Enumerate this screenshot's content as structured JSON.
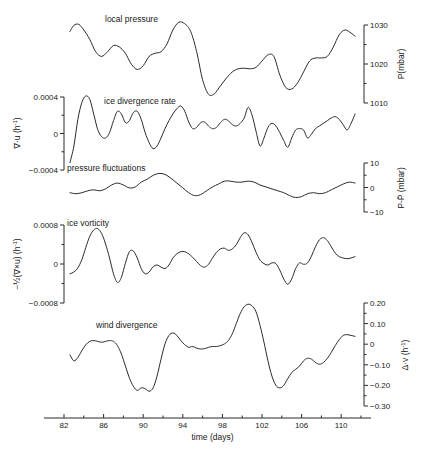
{
  "figure": {
    "background": "#ffffff",
    "line_color": "#2b2b2b",
    "xaxis": {
      "label": "time (days)",
      "ticks": [
        "82",
        "86",
        "90",
        "94",
        "98",
        "102",
        "106",
        "110"
      ],
      "range": [
        82,
        112
      ]
    }
  },
  "panels": [
    {
      "id": "local-pressure",
      "curve_label": "local pressure",
      "axis_side": "right",
      "axis_title": "P(mbar)",
      "ticks": [
        "1030",
        "1020",
        "1010"
      ],
      "range": [
        1006,
        1034
      ]
    },
    {
      "id": "ice-divergence-rate",
      "curve_label": "ice divergence rate",
      "axis_side": "left",
      "axis_title_main": "∇·u",
      "axis_title_units": "(h",
      "axis_title_exp": "-1",
      "axis_title_close": ")",
      "ticks": [
        "0.0004",
        "0",
        "−0.0004"
      ],
      "range": [
        -0.0006,
        0.0006
      ]
    },
    {
      "id": "pressure-fluctuations",
      "curve_label": "pressure fluctuations",
      "axis_side": "right",
      "axis_title": "P-P̄ (mbar)",
      "ticks": [
        "10",
        "0",
        "−10"
      ],
      "range": [
        -14,
        14
      ]
    },
    {
      "id": "ice-vorticity",
      "curve_label": "ice vorticity",
      "axis_side": "left",
      "axis_title_main": "−½(∇×u)",
      "axis_title_units": "(h",
      "axis_title_exp": "-1",
      "axis_title_close": ")",
      "ticks": [
        "0.0008",
        "0",
        "−0.0008"
      ],
      "range": [
        -0.0012,
        0.0012
      ]
    },
    {
      "id": "wind-divergence",
      "curve_label": "wind divergence",
      "axis_side": "right",
      "axis_title_main": "Δ·v",
      "axis_title_units": "(h",
      "axis_title_exp": "-1",
      "axis_title_close": ")",
      "ticks": [
        "0.20",
        "0.10",
        "0",
        "−0.10",
        "−0.20",
        "−0.30"
      ],
      "range": [
        -0.33,
        0.25
      ]
    }
  ],
  "chart_data": {
    "type": "line",
    "title": "",
    "xlabel": "time (days)",
    "ylabel": "",
    "xlim": [
      82,
      112
    ],
    "grid": false,
    "legend": "inline-curve-labels",
    "series": [
      {
        "name": "local pressure",
        "unit": "mbar",
        "ylabel": "P(mbar)",
        "ylim": [
          1006,
          1034
        ],
        "yticks": [
          1030,
          1020,
          1010
        ],
        "x": [
          82.6,
          83.0,
          83.5,
          84.0,
          84.6,
          85.2,
          85.8,
          86.4,
          87.0,
          87.6,
          88.2,
          88.8,
          89.4,
          90.0,
          90.6,
          91.2,
          91.8,
          92.4,
          93.0,
          93.6,
          94.2,
          94.8,
          95.4,
          96.0,
          96.6,
          97.2,
          97.8,
          98.4,
          99.0,
          99.6,
          100.2,
          100.8,
          101.4,
          102.0,
          102.6,
          103.2,
          103.8,
          104.4,
          105.0,
          105.6,
          106.2,
          106.8,
          107.4,
          108.0,
          108.6,
          109.2,
          109.8,
          110.4,
          111.0,
          111.4
        ],
        "y": [
          1029.0,
          1031.0,
          1031.3,
          1029.5,
          1026.5,
          1022.5,
          1021.0,
          1022.5,
          1024.5,
          1024.0,
          1022.0,
          1018.5,
          1016.8,
          1018.0,
          1021.0,
          1022.0,
          1022.5,
          1025.0,
          1029.5,
          1032.0,
          1031.5,
          1029.0,
          1022.5,
          1013.5,
          1008.8,
          1009.0,
          1011.5,
          1014.0,
          1016.0,
          1017.0,
          1017.2,
          1017.0,
          1017.5,
          1019.5,
          1021.5,
          1021.0,
          1015.0,
          1011.0,
          1010.5,
          1012.5,
          1016.0,
          1019.5,
          1020.5,
          1020.5,
          1021.0,
          1024.0,
          1028.0,
          1029.5,
          1028.5,
          1027.5
        ]
      },
      {
        "name": "ice divergence rate",
        "unit": "h^-1",
        "ylabel": "∇·u (h⁻¹)",
        "ylim": [
          -0.0006,
          0.0006
        ],
        "yticks": [
          0.0004,
          0,
          -0.0004
        ],
        "x": [
          82.6,
          83.0,
          83.4,
          83.8,
          84.2,
          84.6,
          85.0,
          85.4,
          85.8,
          86.2,
          86.6,
          87.0,
          87.4,
          87.8,
          88.2,
          88.6,
          89.0,
          89.4,
          89.8,
          90.2,
          90.6,
          91.0,
          91.4,
          91.8,
          92.2,
          92.6,
          93.0,
          93.4,
          93.8,
          94.2,
          94.6,
          95.0,
          95.4,
          95.8,
          96.2,
          96.6,
          97.0,
          97.4,
          97.8,
          98.2,
          98.6,
          99.0,
          99.4,
          99.8,
          100.2,
          100.6,
          101.0,
          101.4,
          101.8,
          102.2,
          102.6,
          103.0,
          103.4,
          103.8,
          104.2,
          104.6,
          105.0,
          105.4,
          105.8,
          106.2,
          106.6,
          107.0,
          107.4,
          107.8,
          108.2,
          108.6,
          109.0,
          109.4,
          109.8,
          110.2,
          110.6,
          111.0,
          111.4
        ],
        "y": [
          -0.00055,
          -0.0003,
          0.0001,
          0.00035,
          0.00045,
          0.0004,
          0.00018,
          -5e-05,
          -0.00016,
          -0.00018,
          -0.0001,
          8e-05,
          0.00022,
          0.00018,
          5e-05,
          8e-05,
          0.0002,
          0.00022,
          0.0001,
          -0.0001,
          -0.00025,
          -0.00034,
          -0.0003,
          -0.00018,
          -4e-05,
          8e-05,
          0.00018,
          0.00026,
          0.0003,
          0.00022,
          6e-05,
          -4e-05,
          -2e-05,
          5e-05,
          6e-05,
          0.0,
          -4e-05,
          -2e-05,
          5e-05,
          0.0001,
          8e-05,
          2e-05,
          0.0,
          4e-05,
          0.00012,
          0.00028,
          0.00016,
          -8e-05,
          -0.0003,
          -0.00018,
          -2e-05,
          4e-05,
          0.0,
          -0.0001,
          -0.00022,
          -0.00032,
          -0.00018,
          -6e-05,
          -4e-05,
          -6e-05,
          -0.00018,
          -0.00012,
          -4e-05,
          0.0,
          4e-05,
          8e-05,
          0.00012,
          0.00014,
          0.0001,
          2e-05,
          -6e-05,
          4e-05,
          0.00018
        ]
      },
      {
        "name": "pressure fluctuations",
        "unit": "mbar",
        "ylabel": "P-P̄ (mbar)",
        "ylim": [
          -14,
          14
        ],
        "yticks": [
          10,
          0,
          -10
        ],
        "x": [
          82.6,
          83.2,
          83.8,
          84.4,
          85.0,
          85.6,
          86.2,
          86.8,
          87.4,
          88.0,
          88.6,
          89.2,
          89.8,
          90.4,
          91.0,
          91.6,
          92.2,
          92.8,
          93.4,
          94.0,
          94.6,
          95.2,
          95.8,
          96.4,
          97.0,
          97.6,
          98.2,
          98.8,
          99.4,
          100.0,
          100.6,
          101.2,
          101.8,
          102.4,
          103.0,
          103.6,
          104.2,
          104.8,
          105.4,
          106.0,
          106.6,
          107.2,
          107.8,
          108.4,
          109.0,
          109.6,
          110.2,
          110.8,
          111.4
        ],
        "y": [
          -4.0,
          -4.5,
          -4.0,
          -3.0,
          -2.5,
          -3.0,
          -2.0,
          0.0,
          1.0,
          0.0,
          -1.5,
          -1.0,
          1.5,
          3.0,
          5.0,
          6.0,
          5.5,
          3.5,
          1.0,
          -1.5,
          -4.0,
          -5.5,
          -5.0,
          -3.0,
          -1.0,
          0.5,
          2.0,
          2.0,
          1.5,
          1.5,
          2.0,
          1.5,
          0.0,
          -1.0,
          -2.0,
          -3.0,
          -4.0,
          -5.5,
          -6.5,
          -6.0,
          -4.5,
          -4.0,
          -4.5,
          -4.0,
          -2.5,
          -1.0,
          0.5,
          1.5,
          1.0
        ]
      },
      {
        "name": "ice vorticity",
        "unit": "h^-1",
        "ylabel": "-½(∇×u) (h⁻¹)",
        "ylim": [
          -0.0012,
          0.0012
        ],
        "yticks": [
          0.0008,
          0,
          -0.0008
        ],
        "x": [
          82.6,
          83.0,
          83.4,
          83.8,
          84.2,
          84.6,
          85.0,
          85.4,
          85.8,
          86.2,
          86.6,
          87.0,
          87.4,
          87.8,
          88.2,
          88.6,
          89.0,
          89.4,
          89.8,
          90.2,
          90.6,
          91.0,
          91.4,
          91.8,
          92.2,
          92.6,
          93.0,
          93.4,
          93.8,
          94.2,
          94.6,
          95.0,
          95.4,
          95.8,
          96.2,
          96.6,
          97.0,
          97.4,
          97.8,
          98.2,
          98.6,
          99.0,
          99.4,
          99.8,
          100.2,
          100.6,
          101.0,
          101.4,
          101.8,
          102.2,
          102.6,
          103.0,
          103.4,
          103.8,
          104.2,
          104.6,
          105.0,
          105.4,
          105.8,
          106.2,
          106.6,
          107.0,
          107.4,
          107.8,
          108.2,
          108.6,
          109.0,
          109.4,
          109.8,
          110.2,
          110.6,
          111.0,
          111.4
        ],
        "y": [
          -0.00045,
          -0.0004,
          -0.00028,
          -5e-05,
          0.0003,
          0.00062,
          0.0008,
          0.00084,
          0.0007,
          0.0004,
          0.0,
          -0.00045,
          -0.0007,
          -0.00055,
          -0.00015,
          0.00018,
          0.0002,
          0.0,
          -0.0003,
          -0.00045,
          -0.0004,
          -0.00025,
          -0.0002,
          -0.00026,
          -0.0003,
          -0.0002,
          0.0,
          0.00012,
          0.00018,
          0.00018,
          0.00012,
          2e-05,
          -0.0001,
          -0.00022,
          -0.00026,
          -0.00018,
          0.0,
          0.00016,
          0.00026,
          0.00028,
          0.00022,
          0.00026,
          0.00038,
          0.00058,
          0.00072,
          0.00066,
          0.00044,
          0.00016,
          -6e-05,
          -0.00016,
          -0.0002,
          -0.00014,
          -0.00016,
          -0.00035,
          -0.0006,
          -0.00075,
          -0.0006,
          -0.0003,
          -0.00014,
          -0.00018,
          -0.00014,
          6e-05,
          0.00032,
          0.00052,
          0.00058,
          0.0005,
          0.00032,
          0.00014,
          4e-05,
          0.0,
          -2e-05,
          0.0,
          4e-05
        ]
      },
      {
        "name": "wind divergence",
        "unit": "h^-1",
        "ylabel": "Δ·v (h⁻¹)",
        "ylim": [
          -0.33,
          0.25
        ],
        "yticks": [
          0.2,
          0.1,
          0,
          -0.1,
          -0.2,
          -0.3
        ],
        "x": [
          82.6,
          83.0,
          83.4,
          83.8,
          84.2,
          84.6,
          85.0,
          85.4,
          85.8,
          86.2,
          86.6,
          87.0,
          87.4,
          87.8,
          88.2,
          88.6,
          89.0,
          89.4,
          89.8,
          90.2,
          90.6,
          91.0,
          91.4,
          91.8,
          92.2,
          92.6,
          93.0,
          93.4,
          93.8,
          94.2,
          94.6,
          95.0,
          95.4,
          95.8,
          96.2,
          96.6,
          97.0,
          97.4,
          97.8,
          98.2,
          98.6,
          99.0,
          99.4,
          99.8,
          100.2,
          100.6,
          101.0,
          101.4,
          101.8,
          102.2,
          102.6,
          103.0,
          103.4,
          103.8,
          104.2,
          104.6,
          105.0,
          105.4,
          105.8,
          106.2,
          106.6,
          107.0,
          107.4,
          107.8,
          108.2,
          108.6,
          109.0,
          109.4,
          109.8,
          110.2,
          110.6,
          111.0,
          111.4
        ],
        "y": [
          -0.075,
          -0.11,
          -0.09,
          -0.05,
          -0.015,
          0.005,
          0.01,
          0.005,
          0.0,
          0.005,
          0.01,
          0.005,
          -0.02,
          -0.07,
          -0.14,
          -0.21,
          -0.26,
          -0.285,
          -0.27,
          -0.275,
          -0.29,
          -0.27,
          -0.2,
          -0.1,
          -0.01,
          0.04,
          0.055,
          0.04,
          0.01,
          -0.015,
          -0.03,
          -0.025,
          -0.035,
          -0.04,
          -0.038,
          -0.03,
          -0.025,
          -0.025,
          -0.02,
          -0.01,
          0.01,
          0.05,
          0.11,
          0.17,
          0.21,
          0.225,
          0.215,
          0.18,
          0.1,
          0.0,
          -0.11,
          -0.2,
          -0.255,
          -0.27,
          -0.255,
          -0.215,
          -0.18,
          -0.16,
          -0.14,
          -0.11,
          -0.095,
          -0.1,
          -0.12,
          -0.13,
          -0.12,
          -0.095,
          -0.06,
          -0.02,
          0.015,
          0.04,
          0.045,
          0.04,
          0.035
        ]
      }
    ]
  }
}
